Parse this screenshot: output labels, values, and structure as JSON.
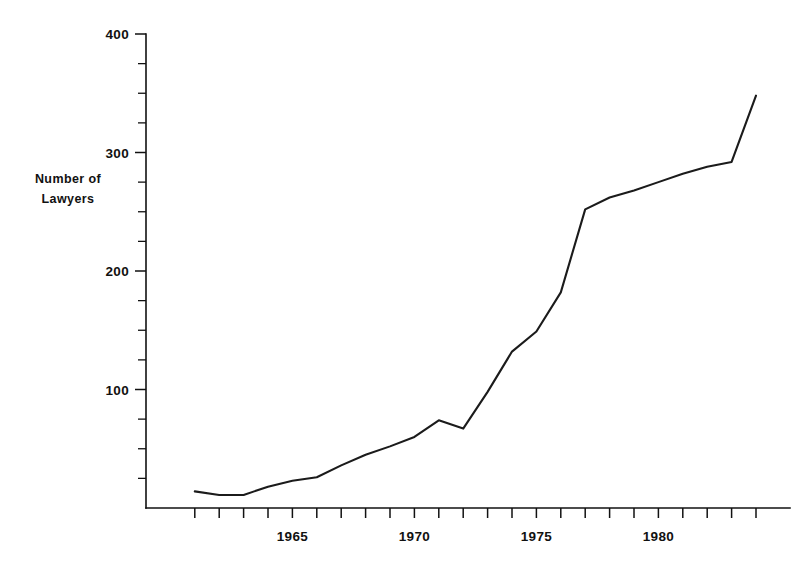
{
  "chart_data": {
    "type": "line",
    "title": "",
    "subtitle": "",
    "xlabel": "",
    "ylabel": "Number of Lawyers",
    "ylabel_lines": [
      "Number of",
      "Lawyers"
    ],
    "x": [
      1961,
      1962,
      1963,
      1964,
      1965,
      1966,
      1967,
      1968,
      1969,
      1970,
      1971,
      1972,
      1973,
      1974,
      1975,
      1976,
      1977,
      1978,
      1979,
      1980,
      1981,
      1982,
      1983,
      1984
    ],
    "values": [
      14,
      11,
      11,
      18,
      23,
      26,
      36,
      45,
      52,
      60,
      74,
      67,
      98,
      132,
      149,
      182,
      252,
      262,
      268,
      275,
      282,
      288,
      292,
      348
    ],
    "series": [
      {
        "name": "Number of Lawyers",
        "values": [
          14,
          11,
          11,
          18,
          23,
          26,
          36,
          45,
          52,
          60,
          74,
          67,
          98,
          132,
          149,
          182,
          252,
          262,
          268,
          275,
          282,
          288,
          292,
          348
        ]
      }
    ],
    "xlim": [
      1961,
      1984
    ],
    "ylim": [
      0,
      400
    ],
    "y_major_ticks": [
      100,
      200,
      300,
      400
    ],
    "y_major_tick_labels": [
      "100",
      "200",
      "300",
      "400"
    ],
    "y_minor_tick_step": 25,
    "x_tick_years": [
      1961,
      1962,
      1963,
      1964,
      1965,
      1966,
      1967,
      1968,
      1969,
      1970,
      1971,
      1972,
      1973,
      1974,
      1975,
      1976,
      1977,
      1978,
      1979,
      1980,
      1981,
      1982,
      1983,
      1984
    ],
    "x_labeled_years": [
      1965,
      1970,
      1975,
      1980
    ],
    "x_tick_labels": [
      "1965",
      "1970",
      "1975",
      "1980"
    ],
    "grid": false,
    "legend": false,
    "legend_position": "none",
    "line_color": "#1b1b1b",
    "axis_color": "#111111",
    "background_color": "#ffffff"
  },
  "geometry": {
    "origin_x": 146,
    "origin_y": 508,
    "y_top_px": 34,
    "px_per_year": 24.4,
    "px_per_unit": 1.185,
    "axis_right_x": 790
  }
}
